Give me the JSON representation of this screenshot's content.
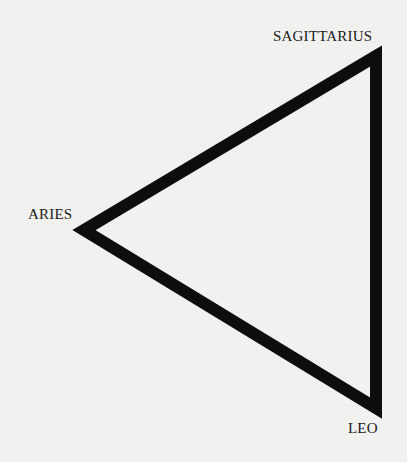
{
  "diagram": {
    "type": "triangle",
    "vertices": [
      {
        "id": "sagittarius",
        "label": "SAGITTARIUS",
        "x": 376,
        "y": 56
      },
      {
        "id": "aries",
        "label": "ARIES",
        "x": 84,
        "y": 230
      },
      {
        "id": "leo",
        "label": "LEO",
        "x": 376,
        "y": 408
      }
    ],
    "stroke_color": "#0d0d0d",
    "background_color": "#f1f1ef",
    "stroke_width": 12
  }
}
